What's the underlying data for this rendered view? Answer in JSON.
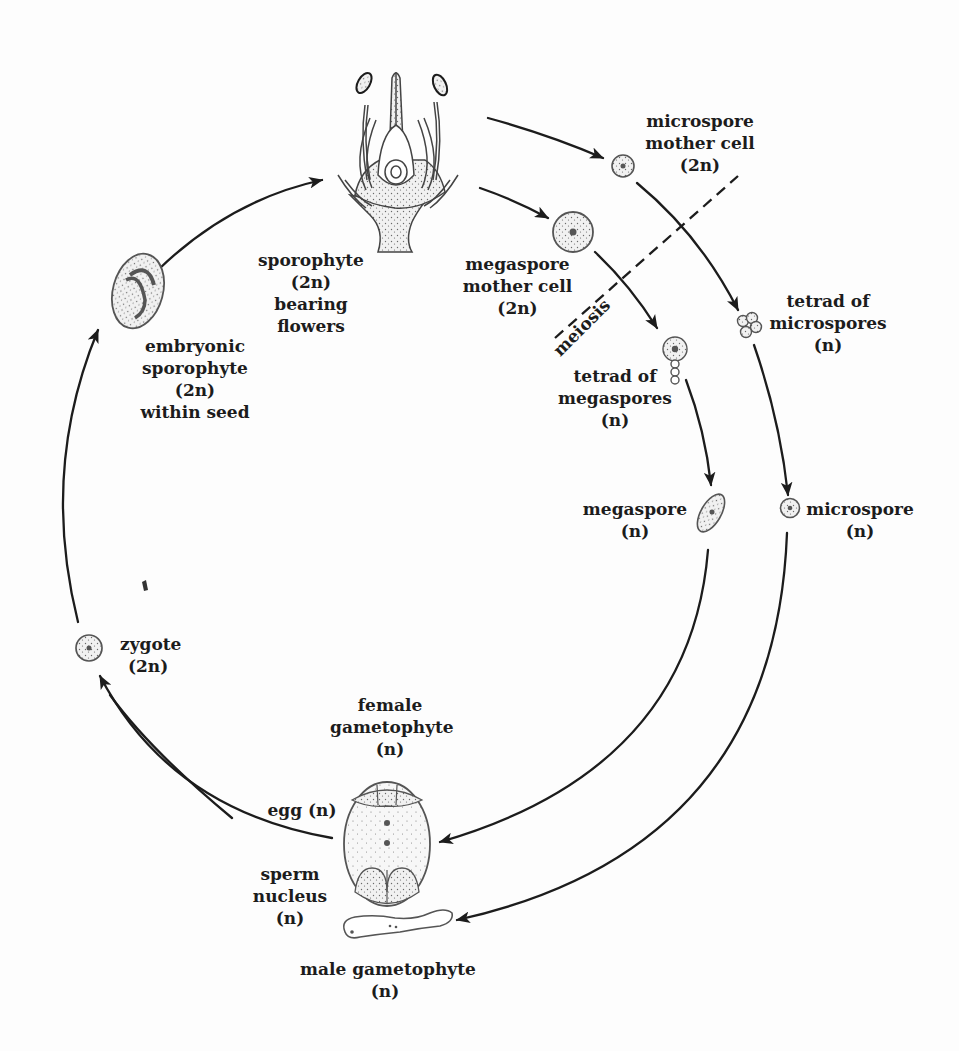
{
  "diagram": {
    "type": "life-cycle",
    "colors": {
      "ink": "#1c1c1c",
      "cell_fill": "#e9e9e9",
      "stipple": "#6a6a6a",
      "background": "#fdfdfd"
    },
    "nodes": {
      "sporophyte": {
        "lines": [
          "sporophyte",
          "(2n)",
          "bearing",
          "flowers"
        ],
        "icon": "flower-icon"
      },
      "microspore_mother_cell": {
        "lines": [
          "microspore",
          "mother cell",
          "(2n)"
        ],
        "icon": "cell-icon"
      },
      "megaspore_mother_cell": {
        "lines": [
          "megaspore",
          "mother cell",
          "(2n)"
        ],
        "icon": "cell-icon"
      },
      "tetrad_microspores": {
        "lines": [
          "tetrad of",
          "microspores",
          "(n)"
        ],
        "icon": "tetrad-icon"
      },
      "tetrad_megaspores": {
        "lines": [
          "tetrad of",
          "megaspores",
          "(n)"
        ],
        "icon": "linear-tetrad-icon"
      },
      "megaspore": {
        "lines": [
          "megaspore",
          "(n)"
        ],
        "icon": "oval-cell-icon"
      },
      "microspore": {
        "lines": [
          "microspore",
          "(n)"
        ],
        "icon": "cell-icon"
      },
      "female_gametophyte": {
        "lines": [
          "female",
          "gametophyte",
          "(n)"
        ],
        "icon": "embryo-sac-icon"
      },
      "egg": {
        "lines": [
          "egg (n)"
        ]
      },
      "sperm_nucleus": {
        "lines": [
          "sperm",
          "nucleus",
          "(n)"
        ]
      },
      "male_gametophyte": {
        "lines": [
          "male gametophyte",
          "(n)"
        ],
        "icon": "pollen-tube-icon"
      },
      "zygote": {
        "lines": [
          "zygote",
          "(2n)"
        ],
        "icon": "cell-icon"
      },
      "embryonic_sporophyte": {
        "lines": [
          "embryonic",
          "sporophyte",
          "(2n)",
          "within seed"
        ],
        "icon": "seed-icon"
      }
    },
    "divider": {
      "label": "meiosis",
      "style": "dashed"
    },
    "edges": [
      {
        "from": "sporophyte",
        "to": "microspore_mother_cell"
      },
      {
        "from": "sporophyte",
        "to": "megaspore_mother_cell"
      },
      {
        "from": "microspore_mother_cell",
        "to": "tetrad_microspores"
      },
      {
        "from": "megaspore_mother_cell",
        "to": "tetrad_megaspores"
      },
      {
        "from": "tetrad_microspores",
        "to": "microspore"
      },
      {
        "from": "tetrad_megaspores",
        "to": "megaspore"
      },
      {
        "from": "megaspore",
        "to": "female_gametophyte"
      },
      {
        "from": "microspore",
        "to": "male_gametophyte"
      },
      {
        "from": "egg",
        "to": "zygote"
      },
      {
        "from": "sperm_nucleus",
        "to": "zygote"
      },
      {
        "from": "zygote",
        "to": "embryonic_sporophyte"
      },
      {
        "from": "embryonic_sporophyte",
        "to": "sporophyte"
      }
    ]
  }
}
